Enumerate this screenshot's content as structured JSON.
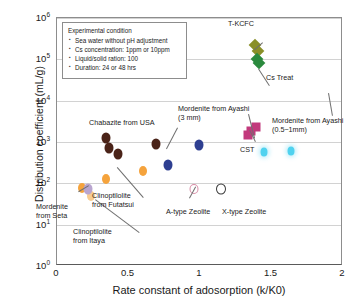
{
  "chart_data": {
    "type": "scatter",
    "title": "",
    "xlabel": "Rate constant of adosorption (k/K0)",
    "ylabel": "Distribution coefficient (mL/g)",
    "xlim": [
      0,
      2
    ],
    "ylim": [
      1,
      1000000
    ],
    "yscale": "log",
    "xscale": "linear",
    "xticks": [
      "0",
      "0.5",
      "1",
      "1.5",
      "2"
    ],
    "xtick_values": [
      0,
      0.5,
      1,
      1.5,
      2
    ],
    "yticks": [
      "10⁰",
      "10¹",
      "10²",
      "10³",
      "10⁴",
      "10⁵",
      "10⁶"
    ],
    "ytick_values": [
      1,
      10,
      100,
      1000,
      10000,
      100000,
      1000000
    ],
    "grid": "horizontal",
    "legend_position": "none",
    "series": [
      {
        "name": "T-KCFC",
        "color": "#8a8f28",
        "marker": "diamond",
        "points": [
          {
            "x": 1.385,
            "y": 220000
          },
          {
            "x": 1.405,
            "y": 160000
          }
        ]
      },
      {
        "name": "Cs Treat",
        "color": "#2b8a3e",
        "marker": "diamond",
        "points": [
          {
            "x": 1.4,
            "y": 105000
          },
          {
            "x": 1.415,
            "y": 80000
          }
        ]
      },
      {
        "name": "Chabazite from USA",
        "color": "#4a2318",
        "marker": "ellipse",
        "points": [
          {
            "x": 0.345,
            "y": 1250
          },
          {
            "x": 0.365,
            "y": 700
          },
          {
            "x": 0.425,
            "y": 500
          },
          {
            "x": 0.695,
            "y": 880
          }
        ]
      },
      {
        "name": "Mordenite from Ayashi (3 mm)",
        "color": "#2e3f91",
        "marker": "ellipse",
        "points": [
          {
            "x": 0.99,
            "y": 850
          },
          {
            "x": 0.775,
            "y": 280
          }
        ]
      },
      {
        "name": "CST",
        "color": "#c2397c",
        "marker": "square",
        "points": [
          {
            "x": 1.335,
            "y": 1450
          },
          {
            "x": 1.355,
            "y": 1900
          },
          {
            "x": 1.39,
            "y": 2300
          }
        ]
      },
      {
        "name": "Mordenite from Ayashi (0.5~1mm)",
        "color": "#4fd2ef",
        "marker": "ellipse-halo",
        "points": [
          {
            "x": 1.445,
            "y": 560
          },
          {
            "x": 1.635,
            "y": 620
          }
        ]
      },
      {
        "name": "Clinoptilolite from Futatsui",
        "color": "#f5a33c",
        "marker": "ellipse",
        "points": [
          {
            "x": 0.345,
            "y": 125
          },
          {
            "x": 0.6,
            "y": 195
          },
          {
            "x": 0.175,
            "y": 78
          }
        ]
      },
      {
        "name": "Clinoptilolite from Itaya",
        "color": "#f8cc90",
        "marker": "ellipse",
        "points": [
          {
            "x": 0.235,
            "y": 50
          }
        ]
      },
      {
        "name": "Mordenite from Seta",
        "color": "#b9a5cf",
        "marker": "ellipse",
        "points": [
          {
            "x": 0.215,
            "y": 75
          }
        ]
      },
      {
        "name": "A-type Zeolite",
        "color": "#d98fa8",
        "marker": "open-circle",
        "points": [
          {
            "x": 0.955,
            "y": 72
          }
        ]
      },
      {
        "name": "X-type Zeolite",
        "color": "#3a3a3a",
        "marker": "open-circle",
        "points": [
          {
            "x": 1.145,
            "y": 75
          }
        ]
      }
    ],
    "annotations": [
      {
        "id": "t-kcfc",
        "text": "T-KCFC"
      },
      {
        "id": "cs-treat",
        "text": "Cs Treat"
      },
      {
        "id": "chabazite",
        "text": "Chabazite from USA"
      },
      {
        "id": "mordenite-3mm",
        "text": "Mordenite from Ayashi\n(3 mm)"
      },
      {
        "id": "mordenite-05",
        "text": "Mordenite from Ayashi\n(0.5~1mm)"
      },
      {
        "id": "cst",
        "text": "CST"
      },
      {
        "id": "clino-futatsui",
        "text": "Clinoptilolite\nfrom Futatsui"
      },
      {
        "id": "clino-itaya",
        "text": "Clinoptilolite\nfrom Itaya"
      },
      {
        "id": "mordenite-seta",
        "text": "Mordenite\nfrom Seta"
      },
      {
        "id": "a-type",
        "text": "A-type Zeolite"
      },
      {
        "id": "x-type",
        "text": "X-type Zeolite"
      }
    ]
  },
  "condition_box": {
    "title": "Experimental condition",
    "items": [
      "Sea water without pH adjustment",
      "Cs concentration: 1ppm or 10ppm",
      "Liquid/solid ration: 100",
      "Duration: 24 or 48 hrs"
    ]
  },
  "axes": {
    "ylabel": "Distribution coefficient (mL/g)",
    "xlabel": "Rate constant of adosorption (k/K0)",
    "ytick_labels": [
      "10⁰",
      "10¹",
      "10²",
      "10³",
      "10⁴",
      "10⁵",
      "10⁶"
    ],
    "xtick_labels": [
      "0",
      "0.5",
      "1",
      "1.5",
      "2"
    ]
  }
}
